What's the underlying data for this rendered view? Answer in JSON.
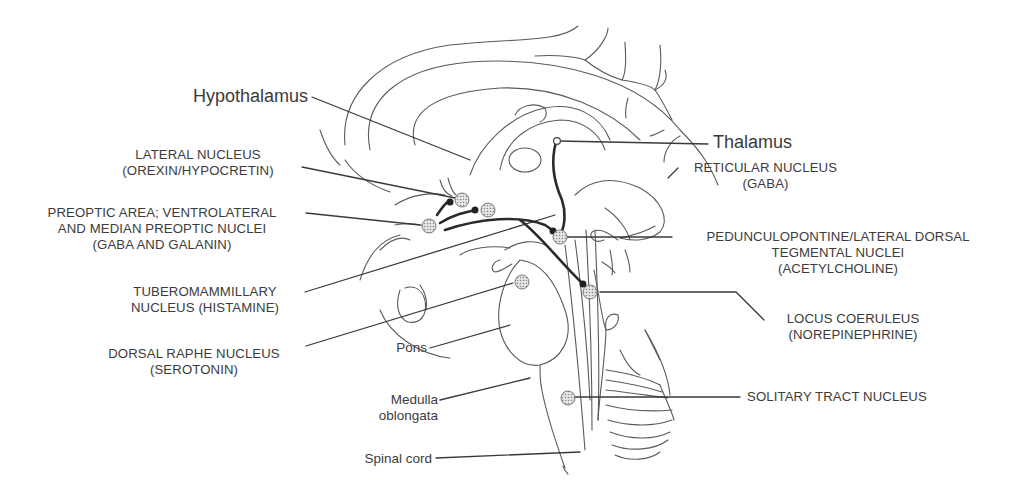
{
  "diagram": {
    "regions": {
      "hypothalamus": "Hypothalamus",
      "thalamus": "Thalamus",
      "pons": "Pons",
      "medulla_line1": "Medulla",
      "medulla_line2": "oblongata",
      "spinal_cord": "Spinal cord"
    },
    "nuclei": {
      "lateral": {
        "line1": "LATERAL NUCLEUS",
        "line2": "(OREXIN/HYPOCRETIN)"
      },
      "preoptic": {
        "line1": "PREOPTIC AREA; VENTROLATERAL",
        "line2": "AND MEDIAN PREOPTIC NUCLEI",
        "line3": "(GABA AND GALANIN)"
      },
      "tuberomammillary": {
        "line1": "TUBEROMAMMILLARY",
        "line2": "NUCLEUS (HISTAMINE)"
      },
      "dorsal_raphe": {
        "line1": "DORSAL RAPHE NUCLEUS",
        "line2": "(SEROTONIN)"
      },
      "reticular": {
        "line1": "RETICULAR NUCLEUS",
        "line2": "(GABA)"
      },
      "pedunculopontine": {
        "line1": "PEDUNCULOPONTINE/LATERAL DORSAL",
        "line2": "TEGMENTAL NUCLEI",
        "line3": "(ACETYLCHOLINE)"
      },
      "locus_coeruleus": {
        "line1": "LOCUS COERULEUS",
        "line2": "(NOREPINEPHRINE)"
      },
      "solitary_tract": {
        "line1": "SOLITARY TRACT NUCLEUS"
      }
    }
  }
}
